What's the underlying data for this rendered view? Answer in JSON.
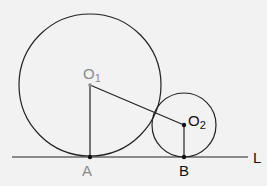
{
  "diagram": {
    "background": "#f2f2f2",
    "stroke_color": "#222222",
    "gray_label_color": "#8a8a8a",
    "line_L": {
      "x1": 12,
      "y1": 157,
      "x2": 248,
      "y2": 157,
      "label": "L"
    },
    "circle_1": {
      "cx": 90,
      "cy": 85,
      "r": 71,
      "center_label": "O",
      "center_sub": "1"
    },
    "circle_2": {
      "cx": 184,
      "cy": 125,
      "r": 32,
      "center_label": "O",
      "center_sub": "2"
    },
    "point_A": {
      "x": 90,
      "y": 157,
      "label": "A"
    },
    "point_B": {
      "x": 184,
      "y": 157,
      "label": "B"
    },
    "segments": [
      {
        "name": "O1A",
        "from": "O1",
        "to": "A"
      },
      {
        "name": "O1O2",
        "from": "O1",
        "to": "O2"
      },
      {
        "name": "O2B",
        "from": "O2",
        "to": "B"
      }
    ]
  }
}
